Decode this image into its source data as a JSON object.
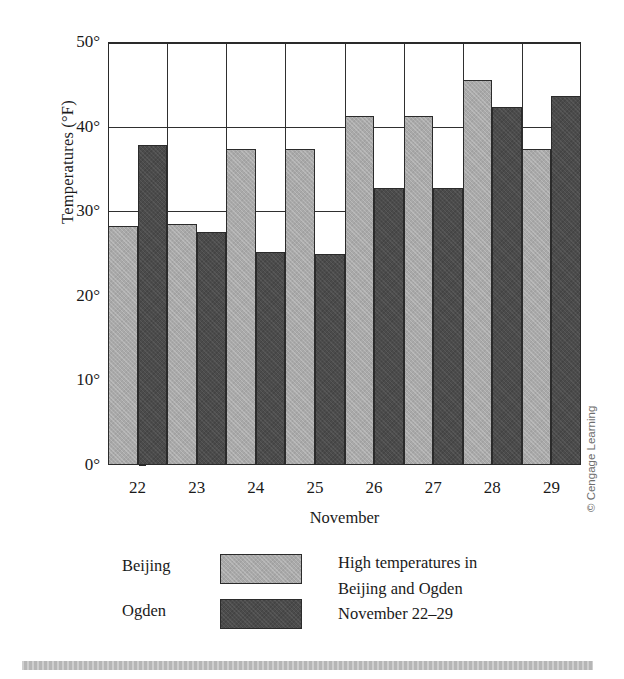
{
  "axes": {
    "y_title": "Temperatures (°F)",
    "x_title": "November",
    "y_ticks": [
      "50°",
      "40°",
      "30°",
      "20°",
      "10°",
      "0°"
    ],
    "x_ticks": [
      "22",
      "23",
      "24",
      "25",
      "26",
      "27",
      "28",
      "29"
    ]
  },
  "legend": {
    "beijing_label": "Beijing",
    "ogden_label": "Ogden"
  },
  "caption": {
    "line1": "High temperatures in",
    "line2": "Beijing and Ogden",
    "line3": "November 22–29"
  },
  "credit": {
    "text": "© Cengage Learning"
  },
  "colors": {
    "beijing": "#a9a9a9",
    "ogden": "#4b4b4b",
    "axis": "#2a2a2a",
    "gridline": "#2f2f2f",
    "bottom_rule": "#b6b6b6"
  },
  "chart_data": {
    "type": "bar",
    "title": "High temperatures in Beijing and Ogden November 22–29",
    "xlabel": "November",
    "ylabel": "Temperatures (°F)",
    "categories": [
      "22",
      "23",
      "24",
      "25",
      "26",
      "27",
      "28",
      "29"
    ],
    "series": [
      {
        "name": "Beijing",
        "color": "#a9a9a9",
        "values": [
          28.3,
          28.5,
          37.4,
          37.3,
          41.2,
          41.2,
          45.5,
          37.3
        ]
      },
      {
        "name": "Ogden",
        "color": "#4b4b4b",
        "values": [
          37.8,
          27.5,
          25.2,
          24.9,
          32.8,
          32.8,
          42.3,
          43.6
        ]
      }
    ],
    "ylim": [
      0,
      50
    ],
    "ytick_values": [
      0,
      10,
      20,
      30,
      40,
      50
    ],
    "grid": true,
    "legend_position": "bottom-left",
    "bar_mode": "grouped-adjacent"
  }
}
